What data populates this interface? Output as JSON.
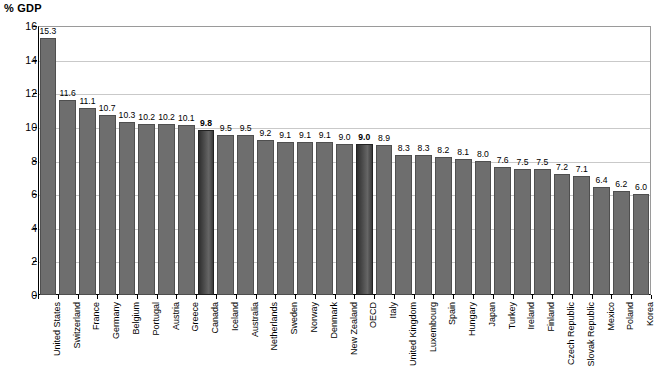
{
  "chart_data": {
    "type": "bar",
    "title": "% GDP",
    "xlabel": "",
    "ylabel": "% GDP",
    "ylim": [
      0,
      16
    ],
    "ytick_step": 2,
    "yticks": [
      "0",
      "2",
      "4",
      "6",
      "8",
      "10",
      "12",
      "14",
      "16"
    ],
    "grid": true,
    "legend": "none",
    "categories": [
      "United States",
      "Switzerland",
      "France",
      "Germany",
      "Belgium",
      "Portugal",
      "Austria",
      "Greece",
      "Canada",
      "Iceland",
      "Australia",
      "Netherlands",
      "Sweden",
      "Norway",
      "Denmark",
      "New Zealand",
      "OECD",
      "Italy",
      "United Kingdom",
      "Luxembourg",
      "Spain",
      "Hungary",
      "Japan",
      "Turkey",
      "Ireland",
      "Finland",
      "Czech Republic",
      "Slovak Republic",
      "Mexico",
      "Poland",
      "Korea"
    ],
    "values": [
      15.3,
      11.6,
      11.1,
      10.7,
      10.3,
      10.2,
      10.2,
      10.1,
      9.8,
      9.5,
      9.5,
      9.2,
      9.1,
      9.1,
      9.1,
      9.0,
      9.0,
      8.9,
      8.3,
      8.3,
      8.2,
      8.1,
      8.0,
      7.6,
      7.5,
      7.5,
      7.2,
      7.1,
      6.4,
      6.2,
      6.0
    ],
    "value_labels": [
      "15.3",
      "11.6",
      "11.1",
      "10.7",
      "10.3",
      "10.2",
      "10.2",
      "10.1",
      "9.8",
      "9.5",
      "9.5",
      "9.2",
      "9.1",
      "9.1",
      "9.1",
      "9.0",
      "9.0",
      "8.9",
      "8.3",
      "8.3",
      "8.2",
      "8.1",
      "8.0",
      "7.6",
      "7.5",
      "7.5",
      "7.2",
      "7.1",
      "6.4",
      "6.2",
      "6.0"
    ],
    "highlighted": [
      "Canada",
      "OECD"
    ],
    "colors": {
      "bar": "#6e6e6e",
      "bar_border": "#4f4f4f",
      "highlight_bar": "#3a3a3a",
      "gridline": "#c9c9c9",
      "axis": "#000000",
      "text": "#000000",
      "background": "#ffffff"
    }
  }
}
